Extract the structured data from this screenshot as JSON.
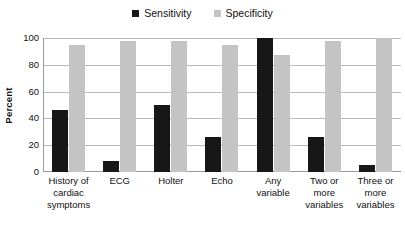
{
  "chart_data": {
    "type": "bar",
    "title": "",
    "subtitle": "",
    "xlabel": "",
    "ylabel": "Percent",
    "ylim": [
      0,
      100
    ],
    "yticks": [
      0,
      20,
      40,
      60,
      80,
      100
    ],
    "grid": true,
    "legend_position": "top-center",
    "categories": [
      "History of cardiac symptoms",
      "ECG",
      "Holter",
      "Echo",
      "Any variable",
      "Two or more variables",
      "Three or more variables"
    ],
    "category_lines": [
      [
        "History of",
        "cardiac",
        "symptoms"
      ],
      [
        "ECG"
      ],
      [
        "Holter"
      ],
      [
        "Echo"
      ],
      [
        "Any",
        "variable"
      ],
      [
        "Two or",
        "more",
        "variables"
      ],
      [
        "Three or",
        "more",
        "variables"
      ]
    ],
    "series": [
      {
        "name": "Sensitivity",
        "color": "#171717",
        "values": [
          46,
          8,
          50,
          26,
          100,
          26,
          5
        ]
      },
      {
        "name": "Specificity",
        "color": "#c4c4c4",
        "values": [
          95,
          98,
          98,
          95,
          87,
          98,
          100
        ]
      }
    ]
  },
  "legend": {
    "entries": [
      {
        "label": "Sensitivity",
        "color": "#171717"
      },
      {
        "label": "Specificity",
        "color": "#c4c4c4"
      }
    ]
  },
  "colors": {
    "sensitivity": "#171717",
    "specificity": "#c4c4c4",
    "gridline": "#b9b9b9",
    "axis": "#9a9a9a",
    "background": "#ffffff",
    "text": "#111111"
  }
}
